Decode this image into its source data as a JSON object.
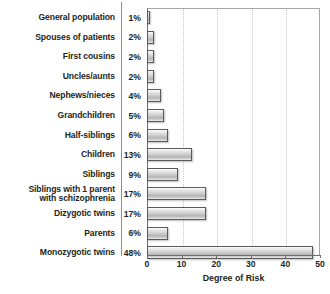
{
  "chart_data": {
    "type": "bar",
    "orientation": "horizontal",
    "title": "",
    "xlabel": "Degree of Risk",
    "ylabel": "",
    "xlim": [
      0,
      50
    ],
    "xticks": [
      0,
      10,
      20,
      30,
      40,
      50
    ],
    "grid": "vertical-dotted",
    "legend": "none",
    "categories": [
      "General population",
      "Spouses of patients",
      "First cousins",
      "Uncles/aunts",
      "Nephews/nieces",
      "Grandchildren",
      "Half-siblings",
      "Children",
      "Siblings",
      "Siblings with 1 parent\nwith schizophrenia",
      "Dizygotic twins",
      "Parents",
      "Monozygotic twins"
    ],
    "values": [
      1,
      2,
      2,
      2,
      4,
      5,
      6,
      13,
      9,
      17,
      17,
      6,
      48
    ],
    "value_labels": [
      "1%",
      "2%",
      "2%",
      "2%",
      "4%",
      "5%",
      "6%",
      "13%",
      "9%",
      "17%",
      "17%",
      "6%",
      "48%"
    ]
  },
  "axis": {
    "tick_labels": [
      "0",
      "10",
      "20",
      "30",
      "40",
      "50"
    ],
    "title": "Degree of Risk"
  },
  "colors": {
    "bar_outline": "#5a5a5a",
    "bar_light": "#fdfdfd",
    "bar_mid": "#cfcfcf",
    "bar_dark": "#b4b4b4",
    "gridline": "#c9c9c9",
    "axis": "#6e6e6e",
    "text": "#231f20",
    "background": "#ffffff"
  }
}
